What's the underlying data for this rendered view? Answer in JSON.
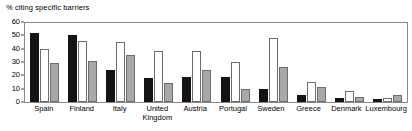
{
  "chart_data": {
    "type": "bar",
    "title": "% citing specific barriers",
    "xlabel": "",
    "ylabel": "",
    "ylim": [
      0,
      60
    ],
    "yticks": [
      0,
      10,
      20,
      30,
      40,
      50,
      60
    ],
    "grid": false,
    "legend": "none",
    "categories": [
      "Spain",
      "Finland",
      "Italy",
      "United\nKingdom",
      "Austria",
      "Portugal",
      "Sweden",
      "Greece",
      "Denmark",
      "Luxembourg"
    ],
    "series": [
      {
        "name": "series-1",
        "color": "#141414",
        "values": [
          52,
          50,
          24,
          18,
          19,
          19,
          10,
          5,
          3,
          2
        ]
      },
      {
        "name": "series-2",
        "color": "#ffffff",
        "values": [
          40,
          46,
          45,
          38,
          38,
          30,
          48,
          15,
          8,
          3
        ]
      },
      {
        "name": "series-3",
        "color": "#a8a8a8",
        "values": [
          29,
          31,
          35,
          14,
          24,
          10,
          26,
          11,
          4,
          5
        ]
      }
    ]
  }
}
